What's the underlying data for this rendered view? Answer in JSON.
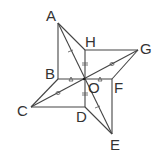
{
  "diagram": {
    "points": {
      "A": {
        "label": "A",
        "x": 58,
        "y": 23
      },
      "H": {
        "label": "H",
        "x": 85,
        "y": 50
      },
      "G": {
        "label": "G",
        "x": 138,
        "y": 50
      },
      "B": {
        "label": "B",
        "x": 58,
        "y": 79
      },
      "O": {
        "label": "O",
        "x": 84,
        "y": 79
      },
      "F": {
        "label": "F",
        "x": 112,
        "y": 79
      },
      "C": {
        "label": "C",
        "x": 31,
        "y": 107
      },
      "D": {
        "label": "D",
        "x": 85,
        "y": 107
      },
      "E": {
        "label": "E",
        "x": 112,
        "y": 134
      }
    },
    "segments": [
      "AB",
      "AH",
      "AE",
      "HG",
      "HD",
      "GF",
      "GC",
      "BF",
      "BC",
      "CD",
      "DE",
      "FE"
    ],
    "equal_marks": {
      "single_tick": [
        "AO",
        "OE"
      ],
      "double_tick": [
        "HO",
        "OD"
      ],
      "circle": [
        "CO",
        "OG"
      ],
      "triangle": [
        "BO",
        "OF"
      ]
    }
  }
}
